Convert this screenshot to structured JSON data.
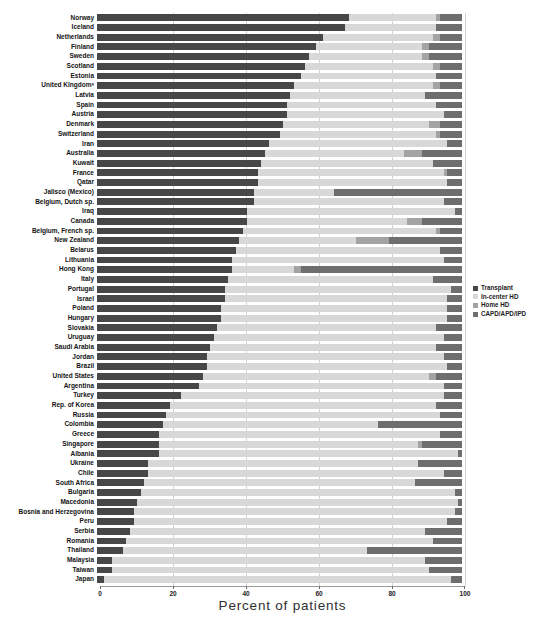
{
  "chart_data": {
    "type": "bar",
    "orientation": "horizontal",
    "stacked": true,
    "title": "",
    "xlabel": "Percent of patients",
    "ylabel": "",
    "xlim": [
      0,
      100
    ],
    "xticks": [
      0,
      20,
      40,
      60,
      80,
      100
    ],
    "grid": "vertical-light",
    "legend_position": "right-middle",
    "colors": {
      "transplant": "#474747",
      "in_center_hd": "#d8d8d8",
      "home_hd": "#a3a3a3",
      "capd_apd_ipd": "#6e6e6e"
    },
    "categories": [
      "Norway",
      "Iceland",
      "Netherlands",
      "Finland",
      "Sweden",
      "Scotland",
      "Estonia",
      "United Kingdomᵃ",
      "Latvia",
      "Spain",
      "Austria",
      "Denmark",
      "Switzerland",
      "Iran",
      "Australia",
      "Kuwait",
      "France",
      "Qatar",
      "Jalisco (Mexico)",
      "Belgium, Dutch sp.",
      "Iraq",
      "Canada",
      "Belgium, French sp.",
      "New Zealand",
      "Belarus",
      "Lithuania",
      "Hong Kong",
      "Italy",
      "Portugal",
      "Israel",
      "Poland",
      "Hungary",
      "Slovakia",
      "Uruguay",
      "Saudi Arabia",
      "Jordan",
      "Brazil",
      "United States",
      "Argentina",
      "Turkey",
      "Rep. of Korea",
      "Russia",
      "Colombia",
      "Greece",
      "Singapore",
      "Albania",
      "Ukraine",
      "Chile",
      "South Africa",
      "Bulgaria",
      "Macedonia",
      "Bosnia and Herzegovina",
      "Peru",
      "Serbia",
      "Romania",
      "Thailand",
      "Malaysia",
      "Taiwan",
      "Japan"
    ],
    "series": [
      {
        "key": "transplant",
        "name": "Transplant",
        "values": [
          69,
          68,
          62,
          60,
          58,
          57,
          56,
          54,
          53,
          52,
          52,
          51,
          50,
          47,
          46,
          45,
          44,
          44,
          43,
          43,
          41,
          41,
          40,
          39,
          38,
          37,
          37,
          36,
          35,
          35,
          34,
          34,
          33,
          32,
          31,
          30,
          30,
          29,
          28,
          23,
          20,
          19,
          18,
          17,
          17,
          17,
          14,
          14,
          13,
          12,
          11,
          10,
          10,
          9,
          8,
          7,
          4,
          4,
          2
        ]
      },
      {
        "key": "in_center_hd",
        "name": "In-center HD",
        "values": [
          24,
          25,
          30,
          29,
          31,
          35,
          37,
          38,
          37,
          41,
          43,
          40,
          43,
          49,
          38,
          47,
          51,
          52,
          22,
          52,
          57,
          44,
          53,
          32,
          56,
          58,
          17,
          56,
          62,
          61,
          62,
          62,
          60,
          63,
          62,
          65,
          66,
          62,
          67,
          72,
          73,
          75,
          59,
          77,
          71,
          82,
          74,
          81,
          74,
          86,
          88,
          88,
          86,
          81,
          84,
          67,
          86,
          87,
          95
        ]
      },
      {
        "key": "home_hd",
        "name": "Home HD",
        "values": [
          1,
          0,
          2,
          2,
          2,
          2,
          0,
          2,
          0,
          0,
          0,
          3,
          1,
          0,
          5,
          0,
          1,
          0,
          0,
          0,
          0,
          4,
          1,
          9,
          0,
          0,
          2,
          0,
          0,
          0,
          0,
          0,
          0,
          0,
          0,
          0,
          0,
          2,
          0,
          0,
          0,
          0,
          0,
          0,
          1,
          0,
          0,
          0,
          0,
          0,
          0,
          0,
          0,
          0,
          0,
          0,
          0,
          0,
          0
        ]
      },
      {
        "key": "capd_apd_ipd",
        "name": "CAPD/APD/IPD",
        "values": [
          6,
          7,
          6,
          9,
          9,
          6,
          7,
          6,
          10,
          7,
          5,
          6,
          6,
          4,
          11,
          8,
          4,
          4,
          35,
          5,
          2,
          11,
          6,
          20,
          6,
          5,
          44,
          8,
          3,
          4,
          4,
          4,
          7,
          5,
          7,
          5,
          4,
          7,
          5,
          5,
          7,
          6,
          23,
          6,
          11,
          1,
          12,
          5,
          13,
          2,
          1,
          2,
          4,
          10,
          8,
          26,
          10,
          9,
          3
        ]
      }
    ]
  },
  "axis": {
    "tick_labels": [
      "0",
      "20",
      "40",
      "60",
      "80",
      "100"
    ],
    "title": "Percent of patients"
  },
  "legend": {
    "items": [
      {
        "label": "Transplant",
        "color": "#474747"
      },
      {
        "label": "In-center HD",
        "color": "#d8d8d8"
      },
      {
        "label": "Home HD",
        "color": "#a3a3a3"
      },
      {
        "label": "CAPD/APD/IPD",
        "color": "#6e6e6e"
      }
    ]
  }
}
